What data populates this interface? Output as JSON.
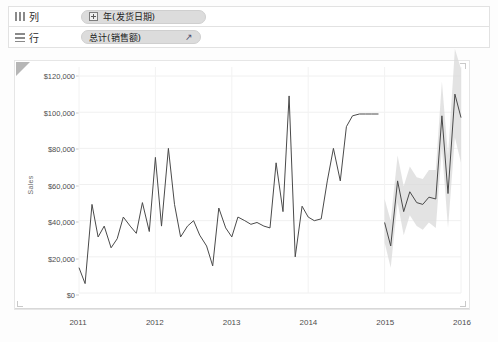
{
  "shelves": {
    "columns": {
      "label": "列",
      "icon": "columns-grid-icon",
      "pill": {
        "text": "年(发货日期)",
        "expand_icon": "plus-expand-icon"
      }
    },
    "rows": {
      "label": "行",
      "icon": "rows-grid-icon",
      "pill": {
        "text": "总计(销售额)",
        "forecast_icon": "forecast-arrow-icon"
      }
    }
  },
  "chart_data": {
    "type": "line",
    "title": "",
    "xlabel": "",
    "ylabel": "Sales",
    "ylim": [
      0,
      125000
    ],
    "ytick_labels": [
      "$0",
      "$20,000",
      "$40,000",
      "$60,000",
      "$80,000",
      "$100,000",
      "$120,000"
    ],
    "ytick_values": [
      0,
      20000,
      40000,
      60000,
      80000,
      100000,
      120000
    ],
    "xtick_labels": [
      "2011",
      "2012",
      "2013",
      "2014",
      "2015",
      "2016"
    ],
    "xtick_values": [
      2011,
      2012,
      2013,
      2014,
      2015,
      2016
    ],
    "grid": true,
    "legend": "none",
    "line_color": "#4a4a4a",
    "band_color": "#d9d9d9",
    "series": [
      {
        "name": "Sales (actual)",
        "x": [
          2011.0,
          2011.08,
          2011.17,
          2011.25,
          2011.33,
          2011.42,
          2011.5,
          2011.58,
          2011.67,
          2011.75,
          2011.83,
          2011.92,
          2012.0,
          2012.08,
          2012.17,
          2012.25,
          2012.33,
          2012.42,
          2012.5,
          2012.58,
          2012.67,
          2012.75,
          2012.83,
          2012.92,
          2013.0,
          2013.08,
          2013.17,
          2013.25,
          2013.33,
          2013.42,
          2013.5,
          2013.58,
          2013.67,
          2013.75,
          2013.83,
          2013.92,
          2014.0,
          2014.08,
          2014.17,
          2014.25,
          2014.33,
          2014.42,
          2014.5,
          2014.58,
          2014.67,
          2014.75,
          2014.83,
          2014.92
        ],
        "values": [
          14000,
          5200,
          49000,
          31000,
          37000,
          25000,
          30000,
          42000,
          37000,
          33000,
          50000,
          34000,
          75000,
          37000,
          80000,
          49000,
          31000,
          37000,
          40000,
          32000,
          26000,
          15000,
          47000,
          36000,
          31000,
          42000,
          40000,
          38000,
          39000,
          37000,
          36000,
          72000,
          45000,
          109000,
          20000,
          48000,
          42000,
          40000,
          41000,
          62000,
          80000,
          62000,
          92000,
          98000,
          99000,
          99000,
          99000,
          99000
        ]
      },
      {
        "name": "Sales (forecast)",
        "x": [
          2015.0,
          2015.08,
          2015.17,
          2015.25,
          2015.33,
          2015.42,
          2015.5,
          2015.58,
          2015.67,
          2015.75,
          2015.83,
          2015.92,
          2016.0
        ],
        "values": [
          39000,
          26000,
          62000,
          45000,
          56000,
          50000,
          49000,
          53000,
          52000,
          98000,
          55000,
          110000,
          97000
        ],
        "lower": [
          28000,
          14000,
          50000,
          32000,
          43000,
          37000,
          35000,
          39000,
          36000,
          80000,
          36000,
          86000,
          72000
        ],
        "upper": [
          52000,
          40000,
          76000,
          59000,
          70000,
          64000,
          63000,
          68000,
          68000,
          117000,
          76000,
          135000,
          124000
        ]
      }
    ]
  }
}
